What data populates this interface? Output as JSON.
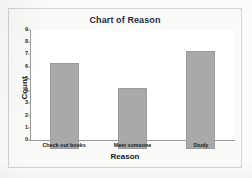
{
  "chart_data": {
    "type": "bar",
    "title": "Chart of Reason",
    "xlabel": "Reason",
    "ylabel": "Count",
    "categories": [
      "Check out books",
      "Meet someone",
      "Study"
    ],
    "values": [
      7,
      5,
      8
    ],
    "ylim": [
      0,
      9
    ],
    "yticks": [
      0,
      1,
      2,
      3,
      4,
      5,
      6,
      7,
      8,
      9
    ],
    "ytick_labels": [
      "0",
      "1",
      "2",
      "3",
      "4",
      "5",
      "6",
      "7",
      "8",
      "9"
    ],
    "grid": false,
    "legend": null,
    "colors": {
      "bar_fill": "#a9a9a9",
      "bar_edge": "#9b9b9b",
      "title_text": "#1f2a44",
      "axis_text": "#1a1a1a",
      "plot_background": "#ffffff",
      "panel_background": "#fafaf9",
      "frame_border": "#d3d3d3"
    }
  }
}
